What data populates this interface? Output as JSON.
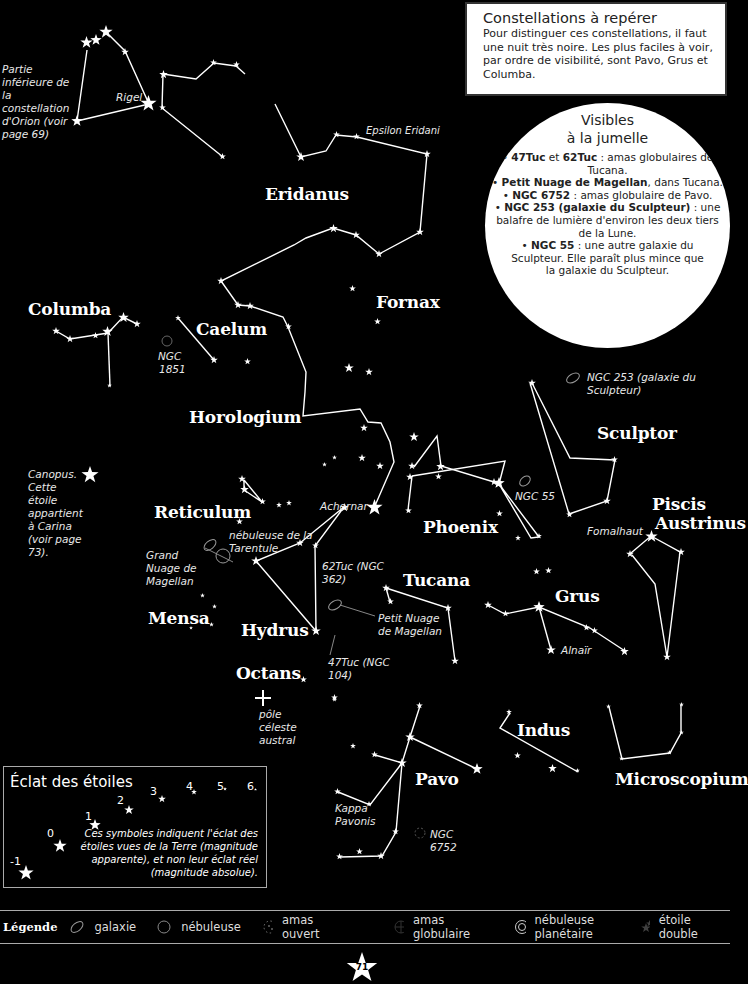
{
  "info_box": {
    "title": "Constellations à repérer",
    "body": "Pour distinguer ces constellations, il faut une nuit très noire. Les plus faciles à voir, par ordre de visibilité, sont Pavo, Grus et Columba."
  },
  "binoculars": {
    "title_line1": "Visibles",
    "title_line2": "à la jumelle",
    "items": [
      {
        "bold": "47Tuc",
        "mid": " et ",
        "bold2": "62Tuc",
        "text": " : amas globulaires de Tucana."
      },
      {
        "bold": "Petit Nuage de Magellan",
        "mid": "",
        "bold2": "",
        "text": ", dans Tucana."
      },
      {
        "bold": "NGC 6752",
        "mid": "",
        "bold2": "",
        "text": " : amas globulaire de Pavo."
      },
      {
        "bold": "NGC 253 (galaxie du Sculpteur)",
        "mid": "",
        "bold2": "",
        "text": " : une balafre de lumière d'environ les deux tiers de la Lune."
      },
      {
        "bold": "NGC 55",
        "mid": "",
        "bold2": "",
        "text": " : une autre galaxie du Sculpteur. Elle paraît plus mince que la galaxie du Sculpteur."
      }
    ]
  },
  "constellations": {
    "eridanus": "Eridanus",
    "fornax": "Fornax",
    "columba": "Columba",
    "caelum": "Caelum",
    "horologium": "Horologium",
    "sculptor": "Sculptor",
    "reticulum": "Reticulum",
    "phoenix": "Phoenix",
    "piscis1": "Piscis",
    "piscis2": "Austrinus",
    "tucana": "Tucana",
    "grus": "Grus",
    "mensa": "Mensa",
    "hydrus": "Hydrus",
    "octans": "Octans",
    "indus": "Indus",
    "pavo": "Pavo",
    "microscopium": "Microscopium"
  },
  "notes": {
    "orion": "Partie inférieure de la constellation d'Orion (voir page 69)",
    "rigel": "Rigel",
    "epsilon": "Epsilon Eridani",
    "ngc1851_1": "NGC",
    "ngc1851_2": "1851",
    "ngc253": "NGC 253 (galaxie du Sculpteur)",
    "ngc55": "NGC 55",
    "canopus": "Canopus. Cette étoile appartient à Carina (voir page 73).",
    "achernar": "Achernar",
    "tarentule": "nébuleuse de la Tarentule",
    "grand_nuage": "Grand Nuage de Magellan",
    "tuc62": "62Tuc (NGC 362)",
    "petit_nuage": "Petit Nuage de Magellan",
    "tuc47": "47Tuc (NGC 104)",
    "fomalhaut": "Fomalhaut",
    "alnair": "Alnaïr",
    "pole": "pôle céleste austral",
    "kappa": "Kappa Pavonis",
    "ngc6752": "NGC 6752"
  },
  "magnitude": {
    "title": "Éclat des étoiles",
    "levels": [
      "-1",
      "0",
      "1",
      "2",
      "3",
      "4",
      "5",
      "6"
    ],
    "note": "Ces symboles indiquent l'éclat des étoiles vues de la Terre (magnitude apparente), et non leur éclat réel (magnitude absolue)."
  },
  "legend": {
    "title": "Légende",
    "items": [
      "galaxie",
      "nébuleuse",
      "amas ouvert",
      "amas globulaire",
      "nébuleuse planétaire",
      "étoile double"
    ]
  },
  "page_number": "71"
}
